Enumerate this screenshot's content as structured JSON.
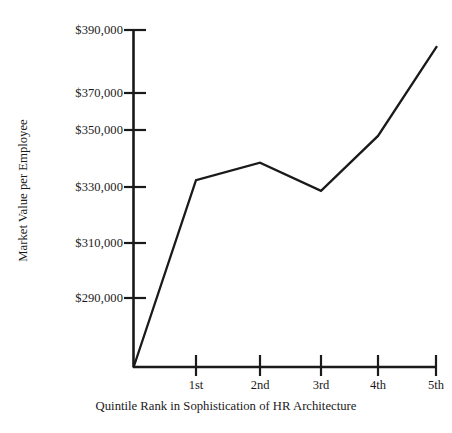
{
  "chart_data": {
    "type": "line",
    "title": "",
    "xlabel": "Quintile Rank in Sophistication of HR Architecture",
    "ylabel": "Market Value per Employee",
    "categories": [
      "1st",
      "2nd",
      "3rd",
      "4th",
      "5th"
    ],
    "series": [
      {
        "name": "Market Value per Employee",
        "values": [
          334000,
          340500,
          330000,
          350500,
          384000
        ]
      }
    ],
    "y_tick_labels": [
      "$290,000",
      "$310,000",
      "$330,000",
      "$350,000",
      "$370,000",
      "$390,000"
    ],
    "y_tick_values": [
      290000,
      310000,
      330000,
      350000,
      370000,
      390000
    ],
    "ylim": [
      270000,
      392000
    ],
    "grid": false,
    "legend": false,
    "line_color": "#1a1a1a",
    "axis_color": "#1a1a1a",
    "background_color": "#ffffff"
  },
  "axis": {
    "y_labels": [
      {
        "text": "$390,000",
        "value": 390000
      },
      {
        "text": "$370,000",
        "value": 370000
      },
      {
        "text": "$350,000",
        "value": 350000
      },
      {
        "text": "$330,000",
        "value": 330000
      },
      {
        "text": "$310,000",
        "value": 310000
      },
      {
        "text": "$290,000",
        "value": 290000
      }
    ],
    "x_labels": [
      {
        "text": "1st"
      },
      {
        "text": "2nd"
      },
      {
        "text": "3rd"
      },
      {
        "text": "4th"
      },
      {
        "text": "5th"
      }
    ],
    "x_title": "Quintile Rank in Sophistication of HR Architecture",
    "y_title": "Market Value per Employee"
  }
}
